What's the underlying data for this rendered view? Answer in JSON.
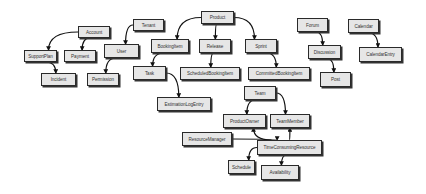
{
  "diagram": {
    "type": "entity-relationship",
    "nodes": [
      {
        "id": "Account",
        "label": "Account"
      },
      {
        "id": "SupportPlan",
        "label": "SupportPlan"
      },
      {
        "id": "Payment",
        "label": "Payment"
      },
      {
        "id": "Incident",
        "label": "Incident"
      },
      {
        "id": "Tenant",
        "label": "Tenant"
      },
      {
        "id": "User",
        "label": "User"
      },
      {
        "id": "Permission",
        "label": "Permission"
      },
      {
        "id": "Product",
        "label": "Product"
      },
      {
        "id": "BookingItem",
        "label": "BookingItem"
      },
      {
        "id": "Release",
        "label": "Release"
      },
      {
        "id": "Sprint",
        "label": "Sprint"
      },
      {
        "id": "Task",
        "label": "Task"
      },
      {
        "id": "ScheduledBookingItem",
        "label": "ScheduledBookingItem"
      },
      {
        "id": "CommittedBookingItem",
        "label": "CommittedBookingItem"
      },
      {
        "id": "EstimationLogEntry",
        "label": "EstimationLogEntry"
      },
      {
        "id": "Forum",
        "label": "Forum"
      },
      {
        "id": "Discussion",
        "label": "Discussion"
      },
      {
        "id": "Post",
        "label": "Post"
      },
      {
        "id": "Calendar",
        "label": "Calendar"
      },
      {
        "id": "CalendarEntry",
        "label": "CalendarEntry"
      },
      {
        "id": "Team",
        "label": "Team"
      },
      {
        "id": "ProductOwner",
        "label": "ProductOwner"
      },
      {
        "id": "TeamMember",
        "label": "TeamMember"
      },
      {
        "id": "ResourceManager",
        "label": "ResourceManager"
      },
      {
        "id": "TimeConsumingResource",
        "label": "TimeConsumingResource"
      },
      {
        "id": "Schedule",
        "label": "Schedule"
      },
      {
        "id": "Availability",
        "label": "Availability"
      }
    ],
    "edges": [
      {
        "from": "Account",
        "to": "SupportPlan"
      },
      {
        "from": "Account",
        "to": "Payment"
      },
      {
        "from": "SupportPlan",
        "to": "Incident"
      },
      {
        "from": "Tenant",
        "to": "User"
      },
      {
        "from": "User",
        "to": "Permission"
      },
      {
        "from": "Product",
        "to": "BookingItem"
      },
      {
        "from": "Product",
        "to": "Release"
      },
      {
        "from": "Product",
        "to": "Sprint"
      },
      {
        "from": "BookingItem",
        "to": "Task"
      },
      {
        "from": "Release",
        "to": "ScheduledBookingItem"
      },
      {
        "from": "Sprint",
        "to": "CommittedBookingItem"
      },
      {
        "from": "Task",
        "to": "EstimationLogEntry"
      },
      {
        "from": "Forum",
        "to": "Discussion"
      },
      {
        "from": "Discussion",
        "to": "Post"
      },
      {
        "from": "Calendar",
        "to": "CalendarEntry"
      },
      {
        "from": "Team",
        "to": "ProductOwner"
      },
      {
        "from": "Team",
        "to": "TeamMember"
      },
      {
        "from": "TimeConsumingResource",
        "to": "ProductOwner"
      },
      {
        "from": "TimeConsumingResource",
        "to": "TeamMember"
      },
      {
        "from": "ResourceManager",
        "to": "TimeConsumingResource"
      },
      {
        "from": "TimeConsumingResource",
        "to": "Schedule"
      },
      {
        "from": "TimeConsumingResource",
        "to": "Availability"
      }
    ]
  }
}
